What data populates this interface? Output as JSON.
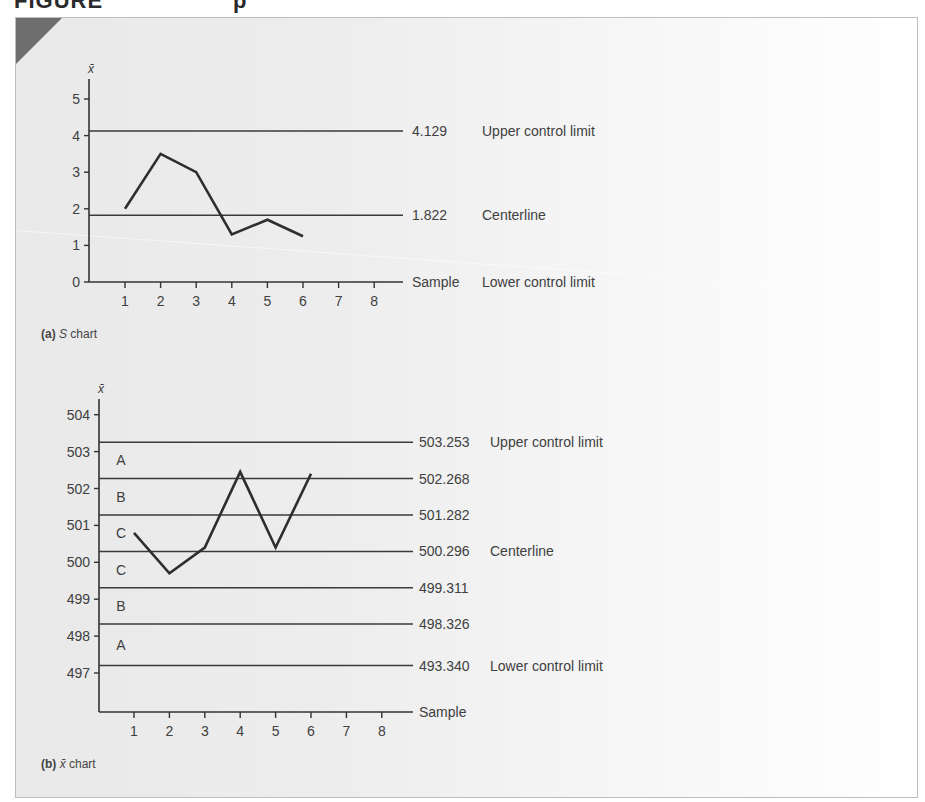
{
  "figure": {
    "header_partial": "FIGURE",
    "header_partial_2": "p"
  },
  "chart_data": [
    {
      "id": "s_chart",
      "type": "line",
      "title": "S chart",
      "caption_label": "(a)",
      "caption_title_italic": "S",
      "caption_title_rest": " chart",
      "xlabel": "Sample",
      "ylabel": "x̄",
      "x": [
        1,
        2,
        3,
        4,
        5,
        6
      ],
      "x_ticks": [
        "1",
        "2",
        "3",
        "4",
        "5",
        "6",
        "7",
        "8"
      ],
      "y_ticks": [
        "0",
        "1",
        "2",
        "3",
        "4",
        "5"
      ],
      "ylim": [
        0,
        5.5
      ],
      "values": [
        2.0,
        3.5,
        3.0,
        1.3,
        1.7,
        1.25
      ],
      "reference_lines": [
        {
          "value": 4.129,
          "label": "4.129",
          "name": "Upper control limit"
        },
        {
          "value": 1.822,
          "label": "1.822",
          "name": "Centerline"
        },
        {
          "value": 0,
          "label": "Sample",
          "name": "Lower control limit"
        }
      ],
      "grid": false
    },
    {
      "id": "xbar_chart",
      "type": "line",
      "title": "x̄ chart",
      "caption_label": "(b)",
      "caption_title_italic": "x̄",
      "caption_title_rest": " chart",
      "xlabel": "Sample",
      "ylabel": "x̄",
      "x": [
        1,
        2,
        3,
        4,
        5,
        6
      ],
      "x_ticks": [
        "1",
        "2",
        "3",
        "4",
        "5",
        "6",
        "7",
        "8"
      ],
      "y_ticks": [
        "497",
        "498",
        "499",
        "500",
        "501",
        "502",
        "503",
        "504"
      ],
      "ylim": [
        496,
        504.5
      ],
      "values": [
        500.8,
        499.7,
        500.4,
        502.45,
        500.4,
        502.4
      ],
      "reference_lines": [
        {
          "value": 503.253,
          "label": "503.253",
          "name": "Upper control limit"
        },
        {
          "value": 502.268,
          "label": "502.268",
          "name": ""
        },
        {
          "value": 501.282,
          "label": "501.282",
          "name": ""
        },
        {
          "value": 500.296,
          "label": "500.296",
          "name": "Centerline"
        },
        {
          "value": 499.311,
          "label": "499.311",
          "name": ""
        },
        {
          "value": 498.326,
          "label": "498.326",
          "name": ""
        },
        {
          "value": 497.2,
          "label": "493.340",
          "name": "Lower control limit"
        }
      ],
      "zones": [
        "A",
        "B",
        "C",
        "C",
        "B",
        "A"
      ],
      "grid": false
    }
  ]
}
